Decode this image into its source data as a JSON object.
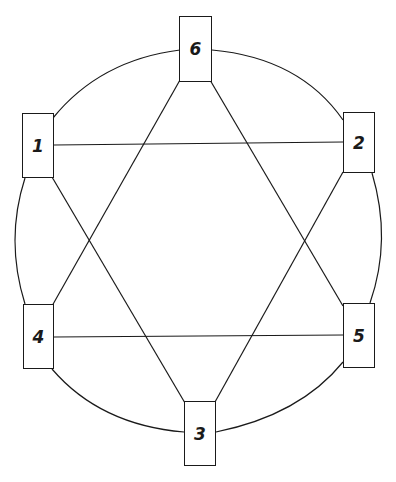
{
  "diagram": {
    "type": "graph",
    "stroke_color": "#1a1a1a",
    "background": "#ffffff",
    "nodes": [
      {
        "id": "1",
        "label": "1",
        "x": 22,
        "y": 113,
        "w": 32,
        "h": 65
      },
      {
        "id": "2",
        "label": "2",
        "x": 343,
        "y": 112,
        "w": 32,
        "h": 61
      },
      {
        "id": "3",
        "label": "3",
        "x": 184,
        "y": 401,
        "w": 32,
        "h": 65
      },
      {
        "id": "4",
        "label": "4",
        "x": 23,
        "y": 304,
        "w": 31,
        "h": 65
      },
      {
        "id": "5",
        "label": "5",
        "x": 343,
        "y": 303,
        "w": 32,
        "h": 65
      },
      {
        "id": "6",
        "label": "6",
        "x": 179,
        "y": 16,
        "w": 33,
        "h": 66
      }
    ],
    "arcs": [
      {
        "from": "6",
        "to": "2"
      },
      {
        "from": "2",
        "to": "5"
      },
      {
        "from": "5",
        "to": "3"
      },
      {
        "from": "3",
        "to": "4"
      },
      {
        "from": "4",
        "to": "1"
      },
      {
        "from": "1",
        "to": "6"
      }
    ],
    "chords": [
      {
        "from": "1",
        "to": "2"
      },
      {
        "from": "4",
        "to": "5"
      },
      {
        "from": "6",
        "to": "4"
      },
      {
        "from": "6",
        "to": "5"
      },
      {
        "from": "1",
        "to": "3"
      },
      {
        "from": "2",
        "to": "3"
      }
    ]
  }
}
